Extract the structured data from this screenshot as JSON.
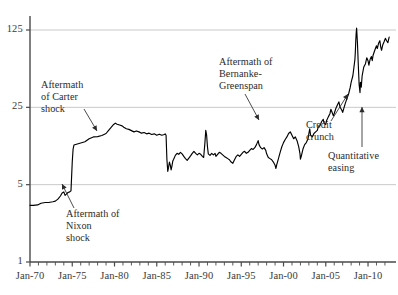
{
  "chart_data": {
    "type": "line",
    "title": "",
    "subtitle": "",
    "xlabel": "",
    "ylabel": "",
    "yscale": "log",
    "ylim": [
      1,
      190
    ],
    "xlim": [
      1970.0,
      2012.6
    ],
    "grid": true,
    "gridlines_y": [
      5,
      25,
      125
    ],
    "legend": "none",
    "y_ticks": [
      {
        "value": 1,
        "label": "1"
      },
      {
        "value": 5,
        "label": "5"
      },
      {
        "value": 25,
        "label": "25"
      },
      {
        "value": 125,
        "label": "125"
      }
    ],
    "x_ticks_labeled": [
      {
        "value": 1970,
        "label": "Jan-70"
      },
      {
        "value": 1975,
        "label": "Jan-75"
      },
      {
        "value": 1980,
        "label": "Jan-80"
      },
      {
        "value": 1985,
        "label": "Jan-85"
      },
      {
        "value": 1990,
        "label": "Jan-90"
      },
      {
        "value": 1995,
        "label": "Jan-95"
      },
      {
        "value": 2000,
        "label": "Jan-00"
      },
      {
        "value": 2005,
        "label": "Jan-05"
      },
      {
        "value": 2010,
        "label": "Jan-10"
      }
    ],
    "x_minor_tick_interval": 1,
    "series": [
      {
        "name": "price",
        "color": "#000000",
        "points": [
          [
            1970.0,
            3.25
          ],
          [
            1970.4,
            3.25
          ],
          [
            1970.9,
            3.28
          ],
          [
            1971.3,
            3.4
          ],
          [
            1971.8,
            3.45
          ],
          [
            1972.2,
            3.45
          ],
          [
            1972.7,
            3.5
          ],
          [
            1973.0,
            3.55
          ],
          [
            1973.3,
            3.7
          ],
          [
            1973.6,
            3.95
          ],
          [
            1973.8,
            4.2
          ],
          [
            1974.0,
            4.3
          ],
          [
            1974.15,
            4.0
          ],
          [
            1974.3,
            4.1
          ],
          [
            1974.5,
            4.25
          ],
          [
            1974.7,
            4.3
          ],
          [
            1974.85,
            4.4
          ],
          [
            1975.0,
            8.0
          ],
          [
            1975.1,
            10.5
          ],
          [
            1975.2,
            11.4
          ],
          [
            1975.5,
            11.6
          ],
          [
            1976.0,
            11.9
          ],
          [
            1976.5,
            12.2
          ],
          [
            1977.0,
            13.0
          ],
          [
            1977.5,
            13.5
          ],
          [
            1978.0,
            13.6
          ],
          [
            1978.5,
            13.9
          ],
          [
            1979.0,
            14.5
          ],
          [
            1979.3,
            15.5
          ],
          [
            1979.6,
            16.5
          ],
          [
            1979.9,
            17.5
          ],
          [
            1980.1,
            18.0
          ],
          [
            1980.3,
            17.6
          ],
          [
            1980.6,
            17.3
          ],
          [
            1980.9,
            17.0
          ],
          [
            1981.1,
            16.5
          ],
          [
            1981.4,
            16.0
          ],
          [
            1981.7,
            15.8
          ],
          [
            1982.0,
            15.4
          ],
          [
            1982.3,
            15.0
          ],
          [
            1982.6,
            15.3
          ],
          [
            1982.9,
            15.0
          ],
          [
            1983.2,
            14.6
          ],
          [
            1983.5,
            14.8
          ],
          [
            1983.8,
            14.4
          ],
          [
            1984.1,
            14.6
          ],
          [
            1984.4,
            14.2
          ],
          [
            1984.7,
            14.4
          ],
          [
            1985.0,
            14.0
          ],
          [
            1985.3,
            14.3
          ],
          [
            1985.6,
            14.0
          ],
          [
            1985.9,
            14.2
          ],
          [
            1986.0,
            14.4
          ],
          [
            1986.1,
            14.0
          ],
          [
            1986.2,
            8.5
          ],
          [
            1986.3,
            6.6
          ],
          [
            1986.4,
            7.2
          ],
          [
            1986.5,
            8.0
          ],
          [
            1986.6,
            7.5
          ],
          [
            1986.7,
            6.8
          ],
          [
            1986.8,
            7.4
          ],
          [
            1986.9,
            8.2
          ],
          [
            1987.0,
            8.5
          ],
          [
            1987.2,
            9.2
          ],
          [
            1987.4,
            9.6
          ],
          [
            1987.6,
            9.4
          ],
          [
            1987.8,
            9.8
          ],
          [
            1988.0,
            9.5
          ],
          [
            1988.2,
            9.0
          ],
          [
            1988.4,
            8.6
          ],
          [
            1988.6,
            8.3
          ],
          [
            1988.8,
            8.7
          ],
          [
            1989.0,
            9.1
          ],
          [
            1989.2,
            9.6
          ],
          [
            1989.4,
            10.0
          ],
          [
            1989.6,
            9.6
          ],
          [
            1989.8,
            9.3
          ],
          [
            1990.0,
            9.6
          ],
          [
            1990.2,
            9.4
          ],
          [
            1990.4,
            9.0
          ],
          [
            1990.55,
            8.8
          ],
          [
            1990.7,
            12.0
          ],
          [
            1990.8,
            15.5
          ],
          [
            1990.9,
            14.0
          ],
          [
            1991.0,
            11.0
          ],
          [
            1991.1,
            9.5
          ],
          [
            1991.3,
            9.2
          ],
          [
            1991.5,
            9.6
          ],
          [
            1991.7,
            9.3
          ],
          [
            1991.9,
            9.6
          ],
          [
            1992.0,
            9.0
          ],
          [
            1992.2,
            9.4
          ],
          [
            1992.4,
            9.8
          ],
          [
            1992.6,
            9.6
          ],
          [
            1992.8,
            9.3
          ],
          [
            1993.0,
            9.0
          ],
          [
            1993.2,
            8.8
          ],
          [
            1993.4,
            8.6
          ],
          [
            1993.6,
            8.4
          ],
          [
            1993.8,
            8.0
          ],
          [
            1994.0,
            7.8
          ],
          [
            1994.2,
            8.4
          ],
          [
            1994.4,
            9.0
          ],
          [
            1994.6,
            9.3
          ],
          [
            1994.8,
            9.0
          ],
          [
            1995.0,
            9.4
          ],
          [
            1995.2,
            9.8
          ],
          [
            1995.4,
            10.0
          ],
          [
            1995.6,
            9.6
          ],
          [
            1995.8,
            9.8
          ],
          [
            1996.0,
            10.2
          ],
          [
            1996.2,
            10.6
          ],
          [
            1996.4,
            10.4
          ],
          [
            1996.6,
            10.8
          ],
          [
            1996.8,
            11.5
          ],
          [
            1997.0,
            12.5
          ],
          [
            1997.1,
            11.5
          ],
          [
            1997.3,
            10.8
          ],
          [
            1997.5,
            10.5
          ],
          [
            1997.7,
            10.8
          ],
          [
            1997.9,
            10.2
          ],
          [
            1998.0,
            9.5
          ],
          [
            1998.2,
            8.8
          ],
          [
            1998.4,
            8.6
          ],
          [
            1998.6,
            8.4
          ],
          [
            1998.8,
            8.0
          ],
          [
            1999.0,
            7.5
          ],
          [
            1999.1,
            7.0
          ],
          [
            1999.2,
            7.6
          ],
          [
            1999.4,
            8.6
          ],
          [
            1999.6,
            9.8
          ],
          [
            1999.8,
            11.0
          ],
          [
            2000.0,
            12.0
          ],
          [
            2000.2,
            12.8
          ],
          [
            2000.4,
            13.5
          ],
          [
            2000.6,
            14.5
          ],
          [
            2000.8,
            15.0
          ],
          [
            2001.0,
            14.0
          ],
          [
            2001.2,
            13.0
          ],
          [
            2001.4,
            13.5
          ],
          [
            2001.6,
            12.5
          ],
          [
            2001.8,
            11.0
          ],
          [
            2001.95,
            9.5
          ],
          [
            2002.0,
            8.5
          ],
          [
            2002.1,
            9.0
          ],
          [
            2002.3,
            10.5
          ],
          [
            2002.5,
            11.5
          ],
          [
            2002.7,
            12.0
          ],
          [
            2002.9,
            13.0
          ],
          [
            2003.0,
            14.5
          ],
          [
            2003.1,
            16.0
          ],
          [
            2003.2,
            14.0
          ],
          [
            2003.4,
            13.5
          ],
          [
            2003.6,
            14.5
          ],
          [
            2003.8,
            15.0
          ],
          [
            2004.0,
            15.5
          ],
          [
            2004.1,
            16.5
          ],
          [
            2004.3,
            17.0
          ],
          [
            2004.5,
            18.5
          ],
          [
            2004.7,
            19.5
          ],
          [
            2004.8,
            18.0
          ],
          [
            2005.0,
            17.5
          ],
          [
            2005.1,
            19.0
          ],
          [
            2005.3,
            20.5
          ],
          [
            2005.5,
            22.0
          ],
          [
            2005.6,
            24.0
          ],
          [
            2005.7,
            23.0
          ],
          [
            2005.9,
            21.0
          ],
          [
            2006.0,
            22.0
          ],
          [
            2006.2,
            24.5
          ],
          [
            2006.4,
            26.5
          ],
          [
            2006.55,
            28.0
          ],
          [
            2006.7,
            25.0
          ],
          [
            2006.9,
            23.5
          ],
          [
            2007.0,
            22.5
          ],
          [
            2007.1,
            24.0
          ],
          [
            2007.3,
            27.0
          ],
          [
            2007.5,
            30.0
          ],
          [
            2007.7,
            33.0
          ],
          [
            2007.9,
            38.0
          ],
          [
            2008.0,
            42.0
          ],
          [
            2008.1,
            45.0
          ],
          [
            2008.2,
            48.0
          ],
          [
            2008.3,
            55.0
          ],
          [
            2008.45,
            68.0
          ],
          [
            2008.5,
            80.0
          ],
          [
            2008.55,
            100.0
          ],
          [
            2008.6,
            118.0
          ],
          [
            2008.65,
            130.0
          ],
          [
            2008.75,
            95.0
          ],
          [
            2008.85,
            60.0
          ],
          [
            2008.95,
            40.0
          ],
          [
            2009.05,
            34.0
          ],
          [
            2009.1,
            42.0
          ],
          [
            2009.2,
            38.0
          ],
          [
            2009.3,
            48.0
          ],
          [
            2009.5,
            58.0
          ],
          [
            2009.7,
            62.0
          ],
          [
            2009.85,
            70.0
          ],
          [
            2010.0,
            66.0
          ],
          [
            2010.1,
            60.0
          ],
          [
            2010.25,
            68.0
          ],
          [
            2010.4,
            72.0
          ],
          [
            2010.5,
            66.0
          ],
          [
            2010.6,
            74.0
          ],
          [
            2010.8,
            82.0
          ],
          [
            2011.0,
            90.0
          ],
          [
            2011.1,
            85.0
          ],
          [
            2011.25,
            95.0
          ],
          [
            2011.4,
            100.0
          ],
          [
            2011.5,
            88.0
          ],
          [
            2011.6,
            82.0
          ],
          [
            2011.75,
            92.0
          ],
          [
            2011.9,
            98.0
          ],
          [
            2012.05,
            105.0
          ],
          [
            2012.2,
            100.0
          ],
          [
            2012.35,
            96.0
          ],
          [
            2012.5,
            108.0
          ]
        ]
      }
    ],
    "annotations": [
      {
        "id": "nixon-shock",
        "text": "Aftermath of\nNixon\nshock",
        "text_x": 66,
        "text_y": 208,
        "arrow_from": [
          74,
          208
        ],
        "arrow_to": [
          62,
          184
        ]
      },
      {
        "id": "carter-shock",
        "text": "Aftermath\nof Carter\nshock",
        "text_x": 41,
        "text_y": 79,
        "arrow_from": [
          84,
          109
        ],
        "arrow_to": [
          97,
          131
        ]
      },
      {
        "id": "bernanke-greenspan",
        "text": "Aftermath of\nBernanke-\nGreenspan",
        "text_x": 219,
        "text_y": 56,
        "arrow_from": [
          245,
          94
        ],
        "arrow_to": [
          259,
          120
        ]
      },
      {
        "id": "credit-crunch",
        "text": "Credit\ncrunch",
        "text_x": 306,
        "text_y": 119,
        "arrow_from": [
          331,
          121
        ],
        "arrow_to": [
          348,
          94
        ]
      },
      {
        "id": "quantitative-easing",
        "text": "Quantitative\neasing",
        "text_x": 328,
        "text_y": 150,
        "arrow_from": [
          362,
          147
        ],
        "arrow_to": [
          362,
          107
        ]
      }
    ]
  },
  "axis_colors": {
    "axis_line": "#4a4a4a",
    "gridline": "#c9c9c9",
    "series": "#000000",
    "text": "#2b2b2b"
  }
}
